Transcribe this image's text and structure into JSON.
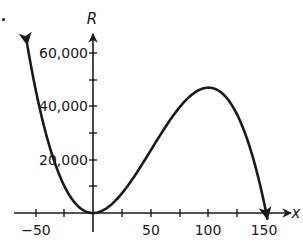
{
  "chart_data": {
    "type": "line",
    "title": "",
    "xlabel": "x",
    "ylabel": "R",
    "xlim": [
      -55,
      155
    ],
    "ylim": [
      0,
      65000
    ],
    "x_ticks": [
      -50,
      -25,
      0,
      25,
      50,
      75,
      100,
      125,
      150
    ],
    "x_tick_labels": [
      "−50",
      "",
      "",
      "",
      "50",
      "",
      "100",
      "",
      "150"
    ],
    "y_ticks": [
      0,
      10000,
      20000,
      30000,
      40000,
      50000,
      60000
    ],
    "y_tick_labels": [
      "",
      "",
      "20,000",
      "",
      "40,000",
      "",
      "60,000"
    ],
    "grid": false,
    "legend": null,
    "series": [
      {
        "name": "R(x)",
        "description": "cubic curve with arrowheads at both ends; local min at (0,0), local max near (100, 47000), crosses x-axis at 150",
        "x": [
          -57,
          -50,
          -25,
          0,
          25,
          50,
          75,
          100,
          125,
          150
        ],
        "values": [
          63200,
          47000,
          10300,
          0,
          7300,
          23500,
          39700,
          47000,
          36700,
          0
        ]
      }
    ],
    "annotations": [
      "•"
    ]
  },
  "axes": {
    "x_name": "x",
    "y_name": "R",
    "labels": {
      "neg50": "−50",
      "p50": "50",
      "p100": "100",
      "p150": "150",
      "y20k": "20,000",
      "y40k": "40,000",
      "y60k": "60,000"
    }
  },
  "colors": {
    "ink": "#1a1a1a",
    "background": "#ffffff"
  }
}
